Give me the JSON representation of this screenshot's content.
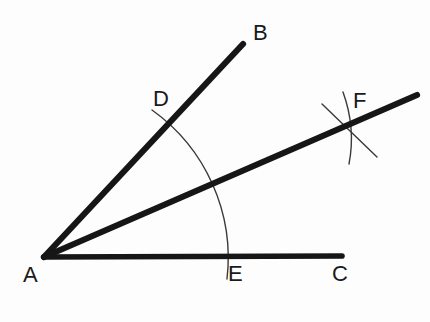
{
  "figure": {
    "background_color": "#fdfdfd",
    "ink_color": "#161616",
    "arc_color": "#3a3a3a",
    "ray_stroke_width": 6,
    "arc_stroke_width": 1.4
  },
  "points": {
    "A": {
      "label": "A",
      "x": 44,
      "y": 257,
      "label_x": 23,
      "label_y": 264,
      "role": "vertex"
    },
    "B": {
      "label": "B",
      "x": 243,
      "y": 44,
      "label_x": 253,
      "label_y": 22,
      "role": "ray-endpoint"
    },
    "C": {
      "label": "C",
      "x": 342,
      "y": 256,
      "label_x": 332,
      "label_y": 263,
      "role": "ray-endpoint"
    },
    "D": {
      "label": "D",
      "x": 171,
      "y": 122,
      "label_x": 153,
      "label_y": 88,
      "role": "arc-intersection"
    },
    "E": {
      "label": "E",
      "x": 224,
      "y": 257,
      "label_x": 228,
      "label_y": 263,
      "role": "arc-intersection"
    },
    "F": {
      "label": "F",
      "x": 350,
      "y": 126,
      "label_x": 353,
      "label_y": 90,
      "role": "arc-intersection"
    }
  },
  "rays": [
    {
      "name": "ray-AB",
      "from": "A",
      "to": "B",
      "x1": 44,
      "y1": 257,
      "x2": 243,
      "y2": 44
    },
    {
      "name": "ray-AF",
      "from": "A",
      "through": "F",
      "x1": 44,
      "y1": 257,
      "x2": 417,
      "y2": 95
    },
    {
      "name": "ray-AC",
      "from": "A",
      "to": "C",
      "x1": 44,
      "y1": 257,
      "x2": 342,
      "y2": 256
    }
  ],
  "arcs": [
    {
      "name": "arc-DE",
      "description": "compass arc centered at A passing through D and E",
      "center_x": 44,
      "center_y": 257,
      "radius": 182,
      "start_x": 152,
      "start_y": 110,
      "end_x": 227,
      "end_y": 279
    },
    {
      "name": "arc-from-D",
      "description": "compass arc centered at D crossing at F",
      "start_x": 322,
      "start_y": 104,
      "end_x": 377,
      "end_y": 157,
      "control_x": 347,
      "control_y": 128
    },
    {
      "name": "arc-from-E",
      "description": "compass arc centered at E crossing at F",
      "start_x": 343,
      "start_y": 92,
      "end_x": 349,
      "end_y": 164,
      "control_x": 356,
      "control_y": 128
    }
  ]
}
